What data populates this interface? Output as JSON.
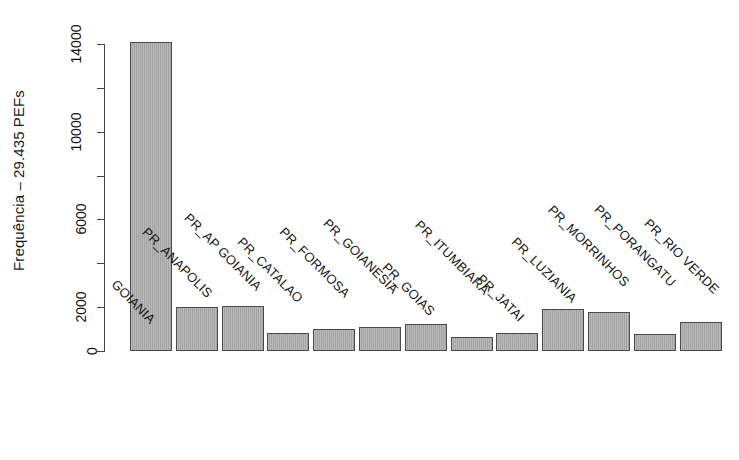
{
  "chart": {
    "title": "",
    "background_color": "#ffffff",
    "bar_fill_color": "#a9a9a9",
    "bar_border_color": "#4a4a4a",
    "axis_color": "#444444",
    "text_color": "#111111"
  },
  "axes": {
    "y_title": "Frequência – 29.435 PEFs",
    "y_ticks": [
      "0",
      "2000",
      "6000",
      "10000",
      "14000"
    ],
    "y_tick_values": [
      0,
      2000,
      6000,
      10000,
      14000
    ],
    "y_minor_tick_values": [
      4000,
      8000,
      12000
    ],
    "y_min": 0,
    "y_max": 14000,
    "x_title": ""
  },
  "chart_data": {
    "type": "bar",
    "title": "",
    "xlabel": "",
    "ylabel": "Frequência – 29.435 PEFs",
    "ylim": [
      0,
      14000
    ],
    "grid": false,
    "legend": false,
    "categories": [
      "GOIANIA",
      "PR_ANAPOLIS",
      "PR_AP GOIANIA",
      "PR_CATALAO",
      "PR_FORMOSA",
      "PR_GOIANESIA",
      "PR_GOIAS",
      "PR_ITUMBIARA",
      "PR_JATAI",
      "PR_LUZIANIA",
      "PR_MORRINHOS",
      "PR_PORANGATU",
      "PR_RIO VERDE"
    ],
    "values": [
      14100,
      2000,
      2050,
      800,
      1000,
      1080,
      1250,
      650,
      820,
      1900,
      1780,
      760,
      1330
    ],
    "ytick_labels": [
      "0",
      "2000",
      "6000",
      "10000",
      "14000"
    ],
    "ytick_values": [
      0,
      2000,
      6000,
      10000,
      14000
    ]
  }
}
